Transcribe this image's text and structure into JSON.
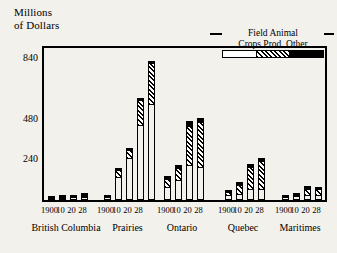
{
  "chart_data": {
    "type": "bar",
    "title": "",
    "ylabel": "Millions of Dollars",
    "ylabel_line1": "Millions",
    "ylabel_line2": "of Dollars",
    "xlabel": "",
    "ylim": [
      0,
      900
    ],
    "yticks": [
      240,
      480,
      840
    ],
    "ytick_labels": [
      "240",
      "480",
      "840"
    ],
    "grid": false,
    "stacked": true,
    "legend_position": "top-right",
    "legend_title_row1": "Field Animal",
    "legend_title_row2": "Crops Prod. Other",
    "series": [
      {
        "name": "Field Crops",
        "pattern": "white"
      },
      {
        "name": "Animal Prod.",
        "pattern": "diagonal-hatch"
      },
      {
        "name": "Other",
        "pattern": "solid-black"
      }
    ],
    "categories": [
      "1900",
      "10",
      "20",
      "28"
    ],
    "groups": [
      {
        "region": "British Columbia",
        "bars": [
          {
            "x": "1900",
            "Field Crops": 5,
            "Animal Prod.": 4,
            "Other": 5,
            "total": 14
          },
          {
            "x": "10",
            "Field Crops": 8,
            "Animal Prod.": 6,
            "Other": 10,
            "total": 24
          },
          {
            "x": "20",
            "Field Crops": 10,
            "Animal Prod.": 8,
            "Other": 12,
            "total": 30
          },
          {
            "x": "28",
            "Field Crops": 14,
            "Animal Prod.": 12,
            "Other": 18,
            "total": 44
          }
        ]
      },
      {
        "region": "Prairies",
        "bars": [
          {
            "x": "1900",
            "Field Crops": 10,
            "Animal Prod.": 6,
            "Other": 10,
            "total": 26
          },
          {
            "x": "10",
            "Field Crops": 130,
            "Animal Prod.": 48,
            "Other": 12,
            "total": 190
          },
          {
            "x": "20",
            "Field Crops": 240,
            "Animal Prod.": 58,
            "Other": 12,
            "total": 310
          },
          {
            "x": "28",
            "Field Crops": 440,
            "Animal Prod.": 150,
            "Other": 14,
            "total": 604
          },
          {
            "x": "",
            "Field Crops": 560,
            "Animal Prod.": 250,
            "Other": 16,
            "total": 826
          }
        ]
      },
      {
        "region": "Ontario",
        "bars": [
          {
            "x": "1900",
            "Field Crops": 70,
            "Animal Prod.": 55,
            "Other": 18,
            "total": 143
          },
          {
            "x": "10",
            "Field Crops": 110,
            "Animal Prod.": 78,
            "Other": 20,
            "total": 208
          },
          {
            "x": "20",
            "Field Crops": 200,
            "Animal Prod.": 240,
            "Other": 30,
            "total": 470
          },
          {
            "x": "28",
            "Field Crops": 190,
            "Animal Prod.": 270,
            "Other": 28,
            "total": 488
          }
        ]
      },
      {
        "region": "Quebec",
        "bars": [
          {
            "x": "1900",
            "Field Crops": 22,
            "Animal Prod.": 28,
            "Other": 12,
            "total": 62
          },
          {
            "x": "10",
            "Field Crops": 32,
            "Animal Prod.": 58,
            "Other": 14,
            "total": 104
          },
          {
            "x": "20",
            "Field Crops": 58,
            "Animal Prod.": 138,
            "Other": 18,
            "total": 214
          },
          {
            "x": "28",
            "Field Crops": 60,
            "Animal Prod.": 170,
            "Other": 20,
            "total": 250
          }
        ]
      },
      {
        "region": "Maritimes",
        "bars": [
          {
            "x": "1900",
            "Field Crops": 12,
            "Animal Prod.": 8,
            "Other": 10,
            "total": 30
          },
          {
            "x": "10",
            "Field Crops": 16,
            "Animal Prod.": 14,
            "Other": 12,
            "total": 42
          },
          {
            "x": "20",
            "Field Crops": 26,
            "Animal Prod.": 42,
            "Other": 14,
            "total": 82
          },
          {
            "x": "28",
            "Field Crops": 24,
            "Animal Prod.": 40,
            "Other": 14,
            "total": 78
          }
        ]
      }
    ],
    "colors": {
      "field_crops": "#ffffff",
      "animal_prod": "#000000",
      "other": "#000000",
      "axis": "#000000",
      "background": "#f3f1ec"
    }
  }
}
